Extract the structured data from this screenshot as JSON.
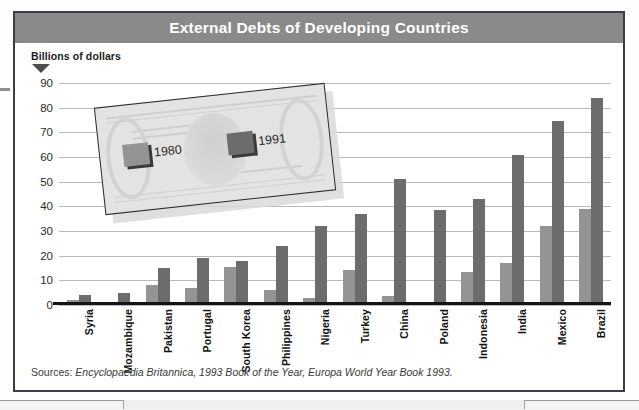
{
  "header": {
    "title": "External Debts of Developing Countries"
  },
  "axis_caption": "Billions of dollars",
  "legend": {
    "items": [
      {
        "label": "1980",
        "color": "#949494"
      },
      {
        "label": "1991",
        "color": "#6c6c6c"
      }
    ]
  },
  "sources": {
    "label": "Sources:",
    "body": "Encyclopaedia Britannica, 1993 Book of the Year, Europa World Year Book 1993."
  },
  "colors": {
    "title_bar": "#8a8a8a",
    "frame": "#3c3c46",
    "bar_1980": "#949494",
    "bar_1991": "#6c6c6c",
    "gridline": "#b9b9b9",
    "baseline": "#141414"
  },
  "chart_data": {
    "type": "bar",
    "title": "External Debts of Developing Countries",
    "xlabel": "",
    "ylabel": "Billions of dollars",
    "ylim": [
      0,
      90
    ],
    "yticks": [
      0,
      10,
      20,
      30,
      40,
      50,
      60,
      70,
      80,
      90
    ],
    "grid": true,
    "legend_position": "upper-left-overlay",
    "categories": [
      "Syria",
      "Mozambique",
      "Pakistan",
      "Portugal",
      "South Korea",
      "Philippines",
      "Nigeria",
      "Turkey",
      "China",
      "Poland",
      "Indonesia",
      "India",
      "Mexico",
      "Brazil"
    ],
    "series": [
      {
        "name": "1980",
        "color": "#949494",
        "values": [
          2,
          0.5,
          8,
          7,
          15.5,
          6,
          3,
          14,
          3.5,
          0,
          13.5,
          17,
          32,
          39
        ]
      },
      {
        "name": "1991",
        "color": "#6c6c6c",
        "values": [
          4,
          5,
          15,
          19,
          18,
          24,
          32,
          37,
          51,
          38.5,
          43,
          61,
          74.5,
          84
        ]
      }
    ]
  }
}
